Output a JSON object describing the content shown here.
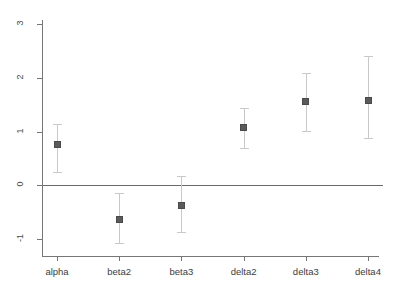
{
  "chart_data": {
    "type": "scatter",
    "title": "",
    "subtitle": "",
    "xlabel": "",
    "ylabel": "",
    "categories": [
      "alpha",
      "beta2",
      "beta3",
      "delta2",
      "delta3",
      "delta4"
    ],
    "values": [
      0.75,
      -0.63,
      -0.37,
      1.08,
      1.55,
      1.58
    ],
    "error_low": [
      0.25,
      -1.08,
      -0.87,
      0.69,
      1.01,
      0.88
    ],
    "error_high": [
      1.14,
      -0.14,
      0.17,
      1.44,
      2.09,
      2.41
    ],
    "ylim": [
      -1.35,
      3.1
    ],
    "yticks": [
      3,
      2,
      1,
      0,
      -1
    ],
    "ytick_labels": [
      "3",
      "2",
      "1",
      "0",
      "-1"
    ],
    "xtick_labels": [
      "alpha",
      "beta2",
      "beta3",
      "delta2",
      "delta3",
      "delta4"
    ],
    "reference_line": 0,
    "grid": false,
    "legend": [],
    "legend_position": "none",
    "marker_color": "#5a5a5a",
    "errorbar_color": "#c9c9c9",
    "axis_color": "#777777",
    "reference_line_color": "#6a6a6a",
    "background_color": "#ffffff",
    "annotations": []
  }
}
